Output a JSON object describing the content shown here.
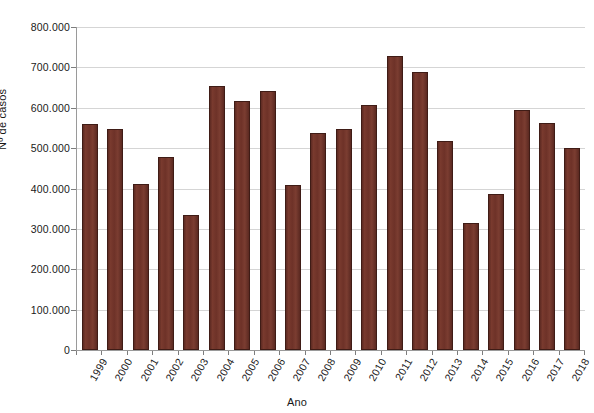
{
  "chart_data": {
    "type": "bar",
    "title": "",
    "xlabel": "Ano",
    "ylabel": "Nº de casos",
    "categories": [
      "1999",
      "2000",
      "2001",
      "2002",
      "2003",
      "2004",
      "2005",
      "2006",
      "2007",
      "2008",
      "2009",
      "2010",
      "2011",
      "2012",
      "2013",
      "2014",
      "2015",
      "2016",
      "2017",
      "2018"
    ],
    "values": [
      559000,
      547000,
      411000,
      478000,
      334000,
      654000,
      617000,
      641000,
      409000,
      538000,
      548000,
      608000,
      728000,
      688000,
      518000,
      315000,
      387000,
      594000,
      562000,
      501000
    ],
    "ylim": [
      0,
      800000
    ],
    "ytick_values": [
      0,
      100000,
      200000,
      300000,
      400000,
      500000,
      600000,
      700000,
      800000
    ],
    "ytick_labels": [
      "0",
      "100.000",
      "200.000",
      "300.000",
      "400.000",
      "500.000",
      "600.000",
      "700.000",
      "800.000"
    ],
    "grid": "horizontal",
    "legend": "none",
    "bar_color": "#6e3228",
    "bar_edge_color": "#3f1c16",
    "gridline_color": "#d5d5d5",
    "axis_color": "#9a9a9a",
    "background": "#ffffff"
  }
}
